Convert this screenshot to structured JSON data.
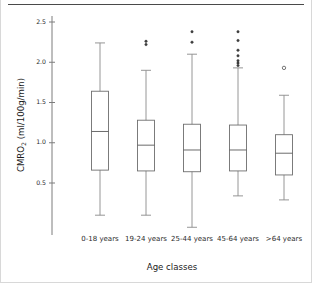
{
  "chart_data": {
    "type": "box",
    "title": "",
    "xlabel": "Age classes",
    "ylabel": "CMRO2 (ml/100g/min)",
    "ylabel_main": "CMRO",
    "ylabel_sub": "2",
    "ylabel_units": " (ml/100g/min)",
    "categories": [
      "0-18 years",
      "19-24 years",
      "25-44 years",
      "45-64 years",
      ">64 years"
    ],
    "ylim": [
      0.0,
      2.55
    ],
    "yticks": [
      0.5,
      1.0,
      1.5,
      2.0,
      2.5
    ],
    "ytick_labels": [
      "0.5",
      "1.0",
      "1.5",
      "2.0",
      "2.5"
    ],
    "grid": false,
    "legend": "none",
    "boxes": [
      {
        "category": "0-18 years",
        "whisker_low": 0.1,
        "q1": 0.66,
        "median": 1.14,
        "q3": 1.64,
        "whisker_high": 2.24,
        "outliers": []
      },
      {
        "category": "19-24 years",
        "whisker_low": 0.1,
        "q1": 0.65,
        "median": 0.97,
        "q3": 1.28,
        "whisker_high": 1.9,
        "outliers": [
          2.26,
          2.22
        ]
      },
      {
        "category": "25-44 years",
        "whisker_low": -0.05,
        "q1": 0.64,
        "median": 0.91,
        "q3": 1.23,
        "whisker_high": 2.1,
        "outliers": [
          2.38,
          2.25
        ]
      },
      {
        "category": "45-64 years",
        "whisker_low": 0.34,
        "q1": 0.65,
        "median": 0.91,
        "q3": 1.22,
        "whisker_high": 1.93,
        "outliers": [
          2.38,
          2.27,
          2.15,
          2.08,
          2.02,
          1.99,
          1.96
        ]
      },
      {
        "category": ">64 years",
        "whisker_low": 0.29,
        "q1": 0.6,
        "median": 0.87,
        "q3": 1.1,
        "whisker_high": 1.59,
        "outliers": [
          1.93
        ]
      }
    ],
    "colors": {
      "box_stroke": "#6e6e6e",
      "median_stroke": "#5a5a5a",
      "whisker_stroke": "#8a8a8a",
      "outlier_fill": "#3d3d3d",
      "axis": "#7c7c7c",
      "text": "#1a1a1a",
      "background": "#ffffff"
    }
  }
}
